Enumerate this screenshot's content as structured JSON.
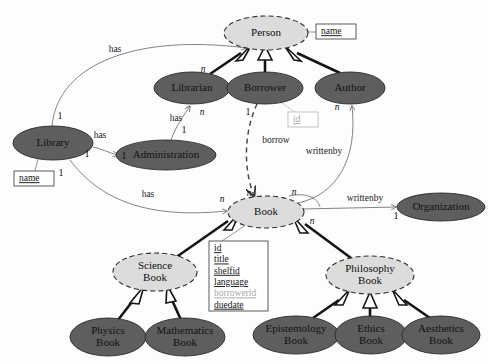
{
  "diagram": {
    "nodes": [
      {
        "id": "person",
        "label_lines": [
          "Person"
        ],
        "kind": "abstract",
        "cx": 266,
        "cy": 33,
        "rx": 42,
        "ry": 17
      },
      {
        "id": "librarian",
        "label_lines": [
          "Librarian"
        ],
        "kind": "solid",
        "cx": 192,
        "cy": 88,
        "rx": 38,
        "ry": 16
      },
      {
        "id": "borrower",
        "label_lines": [
          "Borrower"
        ],
        "kind": "solid",
        "cx": 265,
        "cy": 88,
        "rx": 38,
        "ry": 16
      },
      {
        "id": "author",
        "label_lines": [
          "Author"
        ],
        "kind": "solid",
        "cx": 350,
        "cy": 88,
        "rx": 35,
        "ry": 16
      },
      {
        "id": "library",
        "label_lines": [
          "Library"
        ],
        "kind": "solid",
        "cx": 53,
        "cy": 143,
        "rx": 40,
        "ry": 17
      },
      {
        "id": "administration",
        "label_lines": [
          "Administration"
        ],
        "kind": "solid",
        "cx": 166,
        "cy": 155,
        "rx": 50,
        "ry": 15
      },
      {
        "id": "book",
        "label_lines": [
          "Book"
        ],
        "kind": "abstract",
        "cx": 266,
        "cy": 212,
        "rx": 38,
        "ry": 16
      },
      {
        "id": "organization",
        "label_lines": [
          "Organization"
        ],
        "kind": "solid",
        "cx": 441,
        "cy": 207,
        "rx": 44,
        "ry": 14
      },
      {
        "id": "sciencebook",
        "label_lines": [
          "Science",
          "Book"
        ],
        "kind": "abstract",
        "cx": 155,
        "cy": 272,
        "rx": 42,
        "ry": 19
      },
      {
        "id": "philosophybook",
        "label_lines": [
          "Philosophy",
          "Book"
        ],
        "kind": "abstract",
        "cx": 370,
        "cy": 275,
        "rx": 44,
        "ry": 19
      },
      {
        "id": "physicsbook",
        "label_lines": [
          "Physics",
          "Book"
        ],
        "kind": "solid",
        "cx": 108,
        "cy": 337,
        "rx": 38,
        "ry": 19
      },
      {
        "id": "mathbook",
        "label_lines": [
          "Mathematics",
          "Book"
        ],
        "kind": "solid",
        "cx": 185,
        "cy": 337,
        "rx": 40,
        "ry": 19
      },
      {
        "id": "epistemologybook",
        "label_lines": [
          "Epistemology",
          "Book"
        ],
        "kind": "solid",
        "cx": 296,
        "cy": 335,
        "rx": 43,
        "ry": 19
      },
      {
        "id": "ethicsbook",
        "label_lines": [
          "Ethics",
          "Book"
        ],
        "kind": "solid",
        "cx": 371,
        "cy": 335,
        "rx": 36,
        "ry": 19
      },
      {
        "id": "aestheticsbook",
        "label_lines": [
          "Aesthetics",
          "Book"
        ],
        "kind": "solid",
        "cx": 441,
        "cy": 335,
        "rx": 39,
        "ry": 19
      }
    ],
    "attribute_boxes": [
      {
        "id": "person-name",
        "owner": "person",
        "x": 316,
        "y": 24,
        "w": 40,
        "h": 15,
        "muted": false,
        "attrs": [
          {
            "text": "name",
            "muted": false
          }
        ]
      },
      {
        "id": "borrower-id",
        "owner": "borrower",
        "x": 288,
        "y": 112,
        "w": 30,
        "h": 15,
        "muted": true,
        "attrs": [
          {
            "text": "id",
            "muted": true
          }
        ]
      },
      {
        "id": "library-name",
        "owner": "library",
        "x": 14,
        "y": 171,
        "w": 40,
        "h": 15,
        "muted": false,
        "attrs": [
          {
            "text": "name",
            "muted": false
          }
        ]
      },
      {
        "id": "book-attrs",
        "owner": "book",
        "x": 209,
        "y": 241,
        "w": 59,
        "h": 70,
        "muted": false,
        "attrs": [
          {
            "text": "id",
            "muted": false
          },
          {
            "text": "title",
            "muted": false
          },
          {
            "text": "shelfid",
            "muted": false
          },
          {
            "text": "language",
            "muted": false
          },
          {
            "text": "borrowerid",
            "muted": true
          },
          {
            "text": "duedate",
            "muted": false
          }
        ]
      }
    ],
    "associations": [
      {
        "id": "library-has-book",
        "label": "has",
        "label_x": 148,
        "label_y": 195,
        "from": "library",
        "to": "book"
      },
      {
        "id": "library-has-librarian",
        "label": "has",
        "label_x": 115,
        "label_y": 50,
        "from": "library",
        "to": "librarian"
      },
      {
        "id": "library-has-administration",
        "label": "has",
        "label_x": 100,
        "label_y": 136,
        "from": "library",
        "to": "administration"
      },
      {
        "id": "administration-has-librarian",
        "label": "has",
        "label_x": 176,
        "label_y": 119,
        "from": "administration",
        "to": "librarian"
      },
      {
        "id": "borrower-borrow-book",
        "label": "borrow",
        "label_x": 276,
        "label_y": 141,
        "from": "borrower",
        "to": "book"
      },
      {
        "id": "book-writtenby-author",
        "label": "writtenby",
        "label_x": 324,
        "label_y": 152,
        "from": "book",
        "to": "author"
      },
      {
        "id": "book-writtenby-organization",
        "label": "writtenby",
        "label_x": 365,
        "label_y": 199,
        "from": "book",
        "to": "organization"
      }
    ],
    "cardinalities": [
      {
        "id": "card-library-book-1",
        "text": "1",
        "x": 61,
        "y": 174,
        "italic": false
      },
      {
        "id": "card-book-library-n",
        "text": "n",
        "x": 222,
        "y": 200,
        "italic": true
      },
      {
        "id": "card-library-librarian-1",
        "text": "1",
        "x": 60,
        "y": 117,
        "italic": false
      },
      {
        "id": "card-librarian-library-n",
        "text": "n",
        "x": 203,
        "y": 70,
        "italic": true
      },
      {
        "id": "card-library-admin-1",
        "text": "1",
        "x": 87,
        "y": 155,
        "italic": false
      },
      {
        "id": "card-admin-library-1",
        "text": "1",
        "x": 124,
        "y": 157,
        "italic": false
      },
      {
        "id": "card-admin-librarian-1",
        "text": "1",
        "x": 184,
        "y": 131,
        "italic": false
      },
      {
        "id": "card-librarian-admin-n",
        "text": "n",
        "x": 202,
        "y": 113,
        "italic": true
      },
      {
        "id": "card-borrower-book-1",
        "text": "1",
        "x": 248,
        "y": 113,
        "italic": false
      },
      {
        "id": "card-book-borrower-n",
        "text": "n",
        "x": 249,
        "y": 194,
        "italic": true
      },
      {
        "id": "card-author-book-n",
        "text": "n",
        "x": 337,
        "y": 108,
        "italic": true
      },
      {
        "id": "card-book-author-n",
        "text": "n",
        "x": 294,
        "y": 193,
        "italic": true
      },
      {
        "id": "card-book-org-n",
        "text": "n",
        "x": 312,
        "y": 222,
        "italic": true
      },
      {
        "id": "card-org-book-1",
        "text": "1",
        "x": 396,
        "y": 217,
        "italic": false
      }
    ],
    "generalizations": [
      {
        "id": "gen-librarian-person",
        "from": "librarian",
        "to": "person"
      },
      {
        "id": "gen-borrower-person",
        "from": "borrower",
        "to": "person"
      },
      {
        "id": "gen-author-person",
        "from": "author",
        "to": "person"
      },
      {
        "id": "gen-sciencebook-book",
        "from": "sciencebook",
        "to": "book"
      },
      {
        "id": "gen-philosophybook-book",
        "from": "philosophybook",
        "to": "book"
      },
      {
        "id": "gen-physics-science",
        "from": "physicsbook",
        "to": "sciencebook"
      },
      {
        "id": "gen-math-science",
        "from": "mathbook",
        "to": "sciencebook"
      },
      {
        "id": "gen-epistemology-philosophy",
        "from": "epistemologybook",
        "to": "philosophybook"
      },
      {
        "id": "gen-ethics-philosophy",
        "from": "ethicsbook",
        "to": "philosophybook"
      },
      {
        "id": "gen-aesthetics-philosophy",
        "from": "aestheticsbook",
        "to": "philosophybook"
      }
    ],
    "colors": {
      "solid_fill": "#5e5e5e",
      "abstract_fill": "#dcdcdc",
      "stroke": "#2a2a2a",
      "link": "#6d6d6d",
      "muted_text": "#a8a8a8",
      "background": "#fdfdfd"
    }
  }
}
